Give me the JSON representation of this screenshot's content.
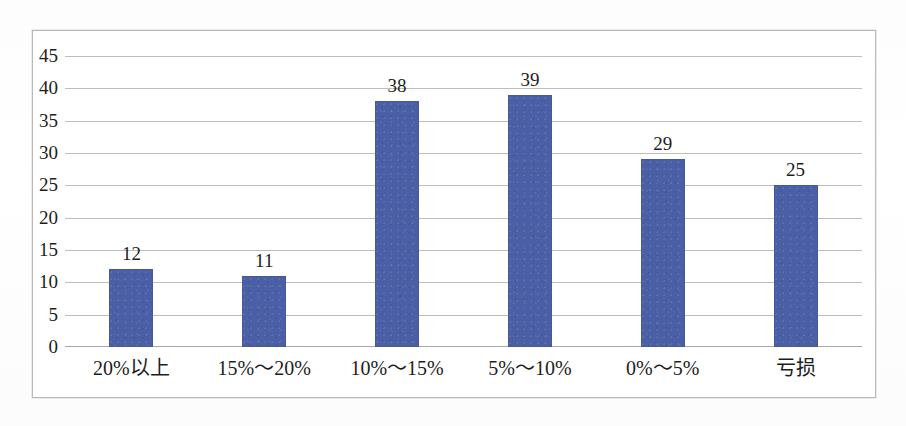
{
  "chart_data": {
    "type": "bar",
    "title": "",
    "subtitle": "",
    "xlabel": "",
    "ylabel": "",
    "categories": [
      "20%以上",
      "15%～20%",
      "10%～15%",
      "5%～10%",
      "0%～5%",
      "亏损"
    ],
    "values": [
      12,
      11,
      38,
      39,
      29,
      25
    ],
    "data_labels": [
      "12",
      "11",
      "38",
      "39",
      "29",
      "25"
    ],
    "ylim": [
      0,
      45
    ],
    "ytick_step": 5,
    "ytick_labels": [
      "45",
      "40",
      "35",
      "30",
      "25",
      "20",
      "15",
      "10",
      "5",
      "0"
    ],
    "ytick_values": [
      45,
      40,
      35,
      30,
      25,
      20,
      15,
      10,
      5,
      0
    ],
    "grid": true,
    "grid_axis": "y",
    "legend": false,
    "legend_position": "none",
    "series": [
      {
        "name": "",
        "values": [
          12,
          11,
          38,
          39,
          29,
          25
        ]
      }
    ],
    "colors": {
      "bar": "#4a5fa5",
      "bar_border": "#49589a",
      "gridline": "#bdbdbd",
      "baseline": "#a8a8a8",
      "frame_border": "#b9b9b9",
      "text": "#1d1d1d",
      "plot_background": "#ffffff",
      "page_background": "#ffffff"
    }
  }
}
